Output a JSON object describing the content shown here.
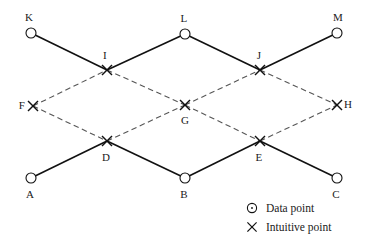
{
  "figure": {
    "background_color": "#ffffff",
    "solid_line_color": "#111111",
    "dashed_line_color": "#555555",
    "marker_color": "#111111",
    "width": 367,
    "height": 243
  },
  "nodes": [
    {
      "id": "K",
      "label": "K",
      "type": "data-point",
      "x": 31,
      "y": 33,
      "label_x": 29,
      "label_y": 17
    },
    {
      "id": "L",
      "label": "L",
      "type": "data-point",
      "x": 185,
      "y": 34,
      "label_x": 184,
      "label_y": 18
    },
    {
      "id": "M",
      "label": "M",
      "type": "data-point",
      "x": 337,
      "y": 33,
      "label_x": 338,
      "label_y": 17
    },
    {
      "id": "I",
      "label": "I",
      "type": "intuitive-point",
      "x": 107,
      "y": 70,
      "label_x": 105,
      "label_y": 55
    },
    {
      "id": "J",
      "label": "J",
      "type": "intuitive-point",
      "x": 260,
      "y": 70,
      "label_x": 259,
      "label_y": 55
    },
    {
      "id": "F",
      "label": "F",
      "type": "intuitive-point",
      "x": 33,
      "y": 106,
      "label_x": 22,
      "label_y": 105
    },
    {
      "id": "G",
      "label": "G",
      "type": "intuitive-point",
      "x": 185,
      "y": 105,
      "label_x": 185,
      "label_y": 120
    },
    {
      "id": "H",
      "label": "H",
      "type": "intuitive-point",
      "x": 337,
      "y": 105,
      "label_x": 348,
      "label_y": 104
    },
    {
      "id": "D",
      "label": "D",
      "type": "intuitive-point",
      "x": 107,
      "y": 141,
      "label_x": 106,
      "label_y": 157
    },
    {
      "id": "E",
      "label": "E",
      "type": "intuitive-point",
      "x": 260,
      "y": 141,
      "label_x": 259,
      "label_y": 157
    },
    {
      "id": "A",
      "label": "A",
      "type": "data-point",
      "x": 31,
      "y": 178,
      "label_x": 30,
      "label_y": 194
    },
    {
      "id": "B",
      "label": "B",
      "type": "data-point",
      "x": 185,
      "y": 178,
      "label_x": 184,
      "label_y": 194
    },
    {
      "id": "C",
      "label": "C",
      "type": "data-point",
      "x": 337,
      "y": 178,
      "label_x": 336,
      "label_y": 194
    }
  ],
  "edges_solid": [
    {
      "from": "K",
      "to": "I"
    },
    {
      "from": "I",
      "to": "L"
    },
    {
      "from": "L",
      "to": "J"
    },
    {
      "from": "J",
      "to": "M"
    },
    {
      "from": "A",
      "to": "D"
    },
    {
      "from": "D",
      "to": "B"
    },
    {
      "from": "B",
      "to": "E"
    },
    {
      "from": "E",
      "to": "C"
    }
  ],
  "edges_dashed": [
    {
      "from": "F",
      "to": "I"
    },
    {
      "from": "I",
      "to": "G"
    },
    {
      "from": "G",
      "to": "J"
    },
    {
      "from": "J",
      "to": "H"
    },
    {
      "from": "F",
      "to": "D"
    },
    {
      "from": "D",
      "to": "G"
    },
    {
      "from": "G",
      "to": "E"
    },
    {
      "from": "E",
      "to": "H"
    }
  ],
  "legend": {
    "items": [
      {
        "marker": "circle-dot-icon",
        "label": "Data point",
        "marker_x": 252,
        "marker_y": 208,
        "text_x": 266,
        "text_y": 208
      },
      {
        "marker": "cross-x-icon",
        "label": "Intuitive point",
        "marker_x": 252,
        "marker_y": 227,
        "text_x": 266,
        "text_y": 227
      }
    ]
  }
}
